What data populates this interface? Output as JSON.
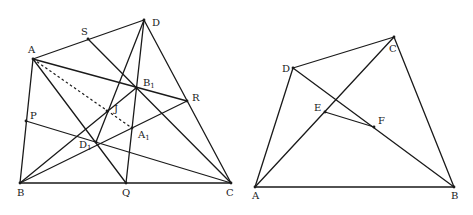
{
  "figures": [
    {
      "id": "left",
      "points": {
        "A": {
          "x": 33,
          "y": 59,
          "label": "A",
          "lx": 28,
          "ly": 53
        },
        "S": {
          "x": 88,
          "y": 39,
          "label": "S",
          "lx": 81,
          "ly": 35
        },
        "D": {
          "x": 144,
          "y": 20,
          "label": "D",
          "lx": 152,
          "ly": 26
        },
        "B1": {
          "x": 136,
          "y": 88,
          "label": "B",
          "sub": "1",
          "lx": 143,
          "ly": 86
        },
        "R": {
          "x": 187,
          "y": 101,
          "label": "R",
          "lx": 192,
          "ly": 101
        },
        "J": {
          "x": 107,
          "y": 111,
          "label": "J",
          "lx": 114,
          "ly": 112
        },
        "P": {
          "x": 26,
          "y": 121,
          "label": "P",
          "lx": 30,
          "ly": 119
        },
        "A1": {
          "x": 132,
          "y": 128,
          "label": "A",
          "sub": "1",
          "lx": 138,
          "ly": 138
        },
        "D1": {
          "x": 96,
          "y": 142,
          "label": "D",
          "sub": "1",
          "lx": 79,
          "ly": 148
        },
        "B": {
          "x": 20,
          "y": 183,
          "label": "B",
          "lx": 17,
          "ly": 196
        },
        "Q": {
          "x": 126,
          "y": 183,
          "label": "Q",
          "lx": 122,
          "ly": 196
        },
        "C": {
          "x": 231,
          "y": 183,
          "label": "C",
          "lx": 226,
          "ly": 196
        }
      },
      "segments": [
        [
          "A",
          "D"
        ],
        [
          "D",
          "C"
        ],
        [
          "B",
          "C"
        ],
        [
          "A",
          "B"
        ],
        [
          "A",
          "R"
        ],
        [
          "A",
          "Q"
        ],
        [
          "S",
          "C"
        ],
        [
          "P",
          "C"
        ],
        [
          "B",
          "B1"
        ],
        [
          "B",
          "R"
        ],
        [
          "D",
          "Q"
        ],
        [
          "D",
          "D1"
        ]
      ],
      "dashed": [
        [
          "A",
          "A1"
        ]
      ]
    },
    {
      "id": "right",
      "points": {
        "A": {
          "x": 255,
          "y": 187,
          "label": "A",
          "lx": 252,
          "ly": 199
        },
        "B": {
          "x": 454,
          "y": 187,
          "label": "B",
          "lx": 451,
          "ly": 199
        },
        "C": {
          "x": 394,
          "y": 37,
          "label": "C",
          "lx": 389,
          "ly": 52
        },
        "D": {
          "x": 293,
          "y": 68,
          "label": "D",
          "lx": 282,
          "ly": 72
        },
        "E": {
          "x": 325,
          "y": 112,
          "label": "E",
          "lx": 314,
          "ly": 111
        },
        "F": {
          "x": 374,
          "y": 127,
          "label": "F",
          "lx": 378,
          "ly": 124
        }
      },
      "segments": [
        [
          "A",
          "B"
        ],
        [
          "B",
          "C"
        ],
        [
          "C",
          "D"
        ],
        [
          "D",
          "A"
        ],
        [
          "A",
          "C"
        ],
        [
          "D",
          "B"
        ],
        [
          "E",
          "F"
        ]
      ],
      "dashed": []
    }
  ]
}
